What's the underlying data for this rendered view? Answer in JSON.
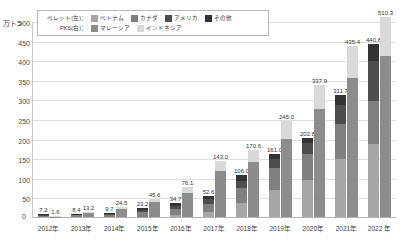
{
  "chart_data": {
    "type": "bar",
    "title": "",
    "subtitle": "",
    "xlabel": "",
    "ylabel": "万トン",
    "ylim": [
      0,
      500
    ],
    "yticks": [
      500,
      450,
      400,
      350,
      300,
      250,
      200,
      150,
      100,
      50
    ],
    "grid": true,
    "legend_position": "top-left-inside",
    "categories": [
      "2012年",
      "2013年",
      "2014年",
      "2015年",
      "2016年",
      "2017年",
      "2018年",
      "2019年",
      "2020年",
      "2021年",
      "2022 年"
    ],
    "group_labels": {
      "pellet": "ペレット(左)：",
      "pks": "PKS(右)："
    },
    "series": [
      {
        "name": "ベトナム",
        "group": "pellet",
        "color": "#a6a6a6",
        "values": [
          0.0,
          0.0,
          0.0,
          0.6,
          4.8,
          12.0,
          35.0,
          69.0,
          94.0,
          147.0,
          185.0
        ]
      },
      {
        "name": "カナダ",
        "group": "pellet",
        "color": "#808080",
        "values": [
          3.7,
          4.4,
          5.0,
          11.0,
          15.0,
          22.0,
          38.0,
          55.0,
          66.0,
          90.0,
          110.0
        ]
      },
      {
        "name": "アメリカ",
        "group": "pellet",
        "color": "#4d4d4d",
        "values": [
          1.5,
          2.0,
          2.4,
          6.0,
          8.0,
          11.0,
          20.0,
          24.0,
          29.0,
          50.0,
          104.0
        ]
      },
      {
        "name": "その他",
        "group": "pellet",
        "color": "#333333",
        "values": [
          2.0,
          2.0,
          2.3,
          5.6,
          6.9,
          7.6,
          13.0,
          13.0,
          13.8,
          24.7,
          41.8
        ]
      },
      {
        "name": "マレーシア",
        "group": "pks",
        "color": "#8c8c8c",
        "values": [
          1.3,
          11.0,
          20.0,
          38.0,
          62.0,
          118.0,
          140.0,
          200.0,
          275.0,
          355.0,
          410.0
        ]
      },
      {
        "name": "インドネシア",
        "group": "pks",
        "color": "#d9d9d9",
        "values": [
          0.3,
          2.2,
          4.5,
          7.6,
          14.1,
          25.0,
          30.6,
          45.0,
          62.9,
          80.4,
          100.3
        ]
      }
    ],
    "bar_totals": {
      "pellet": [
        7.2,
        8.4,
        9.7,
        23.2,
        34.7,
        52.6,
        106.0,
        161.0,
        202.8,
        311.7,
        440.8
      ],
      "pks": [
        1.6,
        13.2,
        24.5,
        45.6,
        76.1,
        143.0,
        170.6,
        245.0,
        337.9,
        435.4,
        510.3
      ]
    },
    "data_labels": {
      "pellet": [
        "7.2",
        "8.4",
        "9.7",
        "23.2",
        "34.7",
        "52.6",
        "106.0",
        "161.0",
        "202.8",
        "311.7",
        "440.8"
      ],
      "pks": [
        "1.6",
        "13.2",
        "24.5",
        "45.6",
        "76.1",
        "143.0",
        "170.6",
        "245.0",
        "337.9",
        "435.4",
        "510.3"
      ]
    },
    "zero_label": "0"
  }
}
